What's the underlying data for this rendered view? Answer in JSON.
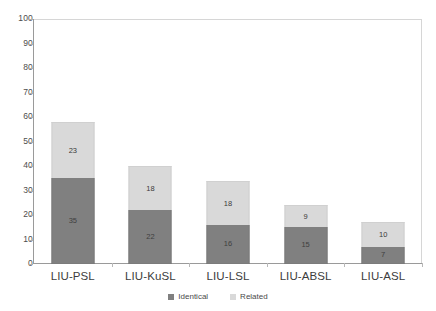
{
  "chart_data": {
    "type": "bar",
    "subtype": "stacked-bar",
    "title": "",
    "xlabel": "",
    "ylabel": "",
    "ylim": [
      0,
      100
    ],
    "ytick_step": 10,
    "yticks": [
      100,
      90,
      80,
      70,
      60,
      50,
      40,
      30,
      20,
      10,
      0
    ],
    "grid": false,
    "legend_position": "bottom-center",
    "categories": [
      "LIU-PSL",
      "LIU-KuSL",
      "LIU-LSL",
      "LIU-ABSL",
      "LIU-ASL"
    ],
    "series": [
      {
        "name": "Identical",
        "color": "#808080",
        "values": [
          35,
          22,
          16,
          15,
          7
        ]
      },
      {
        "name": "Related",
        "color": "#D9D9D9",
        "values": [
          23,
          18,
          18,
          9,
          10
        ]
      }
    ],
    "totals": [
      58,
      40,
      34,
      24,
      17
    ],
    "data_labels_shown": true
  },
  "legend": {
    "items": [
      {
        "label": "Identical",
        "color": "#808080"
      },
      {
        "label": "Related",
        "color": "#D9D9D9"
      }
    ]
  },
  "colors": {
    "identical": "#808080",
    "related": "#D9D9D9",
    "axis": "#9A9A9A",
    "plot_border": "#D6D6D6",
    "tick_text": "#4D4D4D",
    "category_text": "#3D3D3D",
    "background": "#FFFFFF"
  }
}
